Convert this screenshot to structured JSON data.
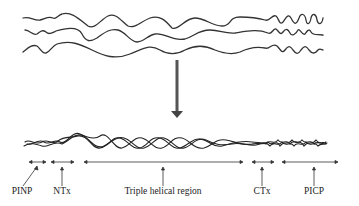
{
  "figure": {
    "top_panel": "three procollagen alpha chains (unwound)",
    "arrow": "processing arrow",
    "bottom_panel": "assembled triple helix"
  },
  "regions": [
    {
      "id": "pinp",
      "label": "PINP",
      "x_center": 22
    },
    {
      "id": "ntx",
      "label": "NTx",
      "x_center": 62
    },
    {
      "id": "triple-helical",
      "label": "Triple helical region",
      "x_center": 163
    },
    {
      "id": "ctx",
      "label": "CTx",
      "x_center": 262
    },
    {
      "id": "picp",
      "label": "PICP",
      "x_center": 314
    }
  ],
  "colors": {
    "line": "#333333",
    "arrow": "#555555",
    "background": "#ffffff"
  }
}
